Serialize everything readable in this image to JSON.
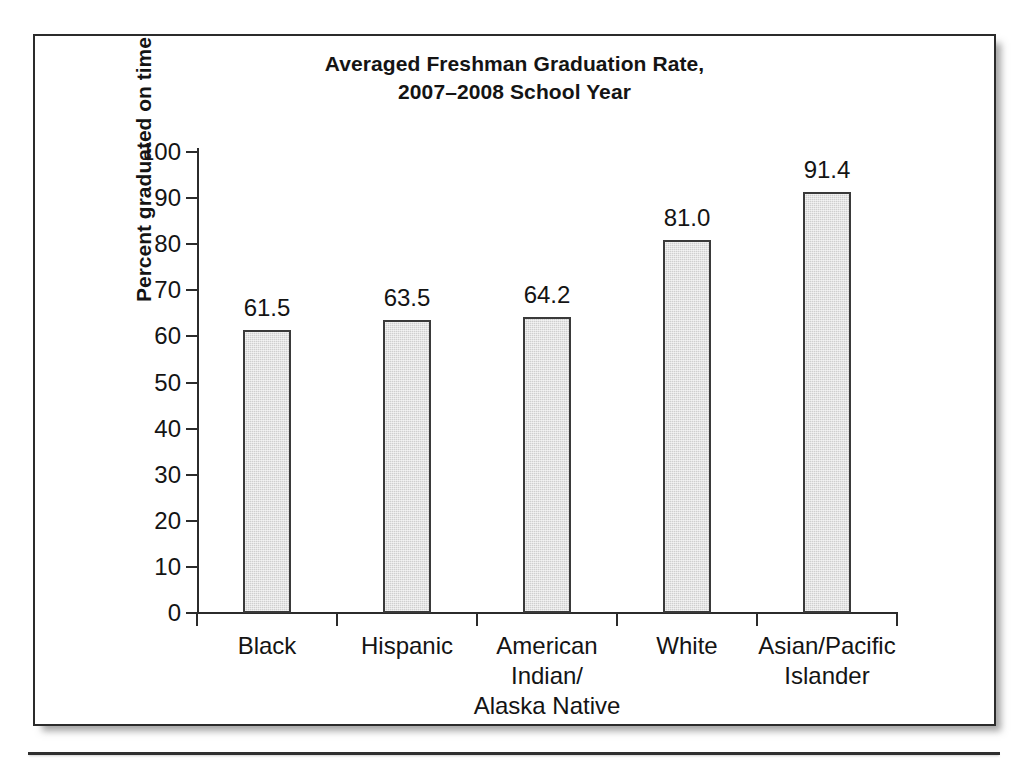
{
  "chart_data": {
    "type": "bar",
    "title": "Averaged Freshman Graduation Rate,\n2007–2008 School Year",
    "title_line1": "Averaged Freshman Graduation Rate,",
    "title_line2": "2007–2008 School Year",
    "xlabel": "",
    "ylabel": "Percent graduated on time",
    "ylim": [
      0,
      100
    ],
    "ytick_labels": [
      "100",
      "90",
      "80",
      "70",
      "60",
      "50",
      "40",
      "30",
      "20",
      "10",
      "0"
    ],
    "yticks": [
      100,
      90,
      80,
      70,
      60,
      50,
      40,
      30,
      20,
      10,
      0
    ],
    "grid": false,
    "legend": false,
    "categories": [
      "Black",
      "Hispanic",
      "American\nIndian/\nAlaska Native",
      "White",
      "Asian/Pacific\nIslander"
    ],
    "values": [
      61.5,
      63.5,
      64.2,
      81.0,
      91.4
    ],
    "value_labels": [
      "61.5",
      "63.5",
      "64.2",
      "81.0",
      "91.4"
    ],
    "bar_fill_color": "#cfcfcf",
    "bar_edge_color": "#3a3a3a",
    "axis_color": "#2b2b2b",
    "text_color": "#141414",
    "background_color": "#ffffff"
  }
}
